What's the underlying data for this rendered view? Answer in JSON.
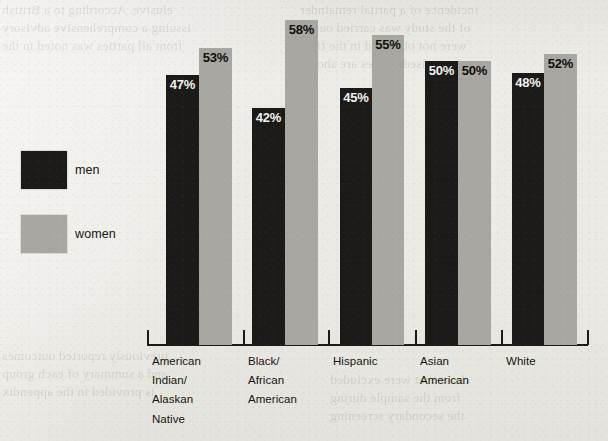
{
  "chart_data": {
    "type": "bar",
    "title": "",
    "subtitle": "",
    "xlabel": "",
    "ylabel": "",
    "ylim": [
      0,
      62
    ],
    "grid": false,
    "legend_position": "left",
    "value_suffix": "%",
    "categories": [
      "American\nIndian/\nAlaskan\nNative",
      "Black/\nAfrican\nAmerican",
      "Hispanic",
      "Asian\nAmerican",
      "White"
    ],
    "series": [
      {
        "name": "men",
        "color": "#1b1a18",
        "values": [
          47,
          42,
          45,
          50,
          48
        ]
      },
      {
        "name": "women",
        "color": "#a9a7a2",
        "values": [
          53,
          58,
          55,
          50,
          52
        ]
      }
    ],
    "data_labels": [
      [
        "47%",
        "53%"
      ],
      [
        "42%",
        "58%"
      ],
      [
        "45%",
        "55%"
      ],
      [
        "50%",
        "50%"
      ],
      [
        "48%",
        "52%"
      ]
    ]
  },
  "legend": {
    "men": {
      "label": "men",
      "color": "#1b1a18"
    },
    "women": {
      "label": "women",
      "color": "#a9a7a2"
    }
  },
  "axis": {
    "ticks": [
      147,
      243,
      328,
      415,
      501,
      587
    ],
    "baseline_y": 344
  },
  "groups": [
    {
      "label": "American\nIndian/\nAlaskan\nNative",
      "label_x": 152,
      "men": {
        "x": 166,
        "w": 33,
        "h": 270,
        "value": "47%"
      },
      "women": {
        "x": 199,
        "w": 33,
        "h": 297,
        "value": "53%"
      }
    },
    {
      "label": "Black/\nAfrican\nAmerican",
      "label_x": 248,
      "men": {
        "x": 252,
        "w": 33,
        "h": 237,
        "value": "42%"
      },
      "women": {
        "x": 285,
        "w": 33,
        "h": 325,
        "value": "58%"
      }
    },
    {
      "label": "Hispanic",
      "label_x": 333,
      "men": {
        "x": 340,
        "w": 32,
        "h": 257,
        "value": "45%"
      },
      "women": {
        "x": 372,
        "w": 32,
        "h": 310,
        "value": "55%"
      }
    },
    {
      "label": "Asian\nAmerican",
      "label_x": 420,
      "men": {
        "x": 425,
        "w": 33,
        "h": 284,
        "value": "50%"
      },
      "women": {
        "x": 458,
        "w": 33,
        "h": 284,
        "value": "50%"
      }
    },
    {
      "label": "White",
      "label_x": 506,
      "men": {
        "x": 512,
        "w": 32,
        "h": 272,
        "value": "48%"
      },
      "women": {
        "x": 544,
        "w": 33,
        "h": 291,
        "value": "52%"
      }
    }
  ],
  "background_bleed": {
    "lines": [
      "elusive. According to a British",
      "issuing a comprehensive advisory",
      "from all parties was noted in the",
      "incidence of a partial remainder",
      "of the study was carried out as",
      "were not observed in the final",
      "the revised figures are shown",
      "previously reported outcomes",
      "and a summary of each group",
      "is provided in the appendix",
      "those that were excluded",
      "from the sample during",
      "the secondary screening"
    ]
  }
}
